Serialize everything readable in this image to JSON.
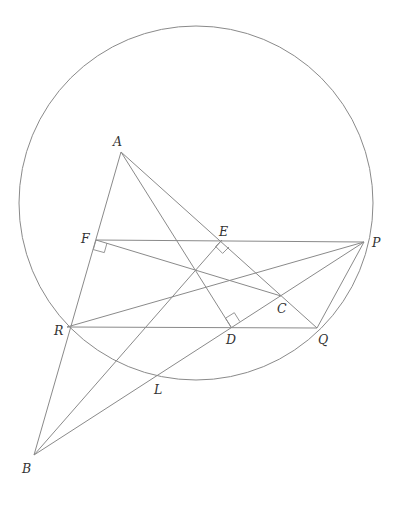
{
  "diagram": {
    "type": "geometry-figure",
    "colors": {
      "line": "#8a8a8a",
      "label": "#333333",
      "background": "#ffffff"
    },
    "circle": {
      "cx": 196,
      "cy": 203,
      "r": 177
    },
    "points": {
      "A": {
        "label": "A",
        "x": 121,
        "y": 152,
        "lx": 113,
        "ly": 146
      },
      "B": {
        "label": "B",
        "x": 34,
        "y": 455,
        "lx": 22,
        "ly": 473
      },
      "C": {
        "label": "C",
        "x": 281,
        "y": 296,
        "lx": 277,
        "ly": 313
      },
      "D": {
        "label": "D",
        "x": 231,
        "y": 327,
        "lx": 226,
        "ly": 344
      },
      "E": {
        "label": "E",
        "x": 222,
        "y": 240,
        "lx": 219,
        "ly": 236
      },
      "F": {
        "label": "F",
        "x": 96,
        "y": 240,
        "lx": 81,
        "ly": 243
      },
      "P": {
        "label": "P",
        "x": 364,
        "y": 242,
        "lx": 372,
        "ly": 247
      },
      "Q": {
        "label": "Q",
        "x": 317,
        "y": 328,
        "lx": 318,
        "ly": 344
      },
      "R": {
        "label": "R",
        "x": 67,
        "y": 327,
        "lx": 54,
        "ly": 335
      },
      "L": {
        "label": "L",
        "x": 156,
        "y": 377,
        "lx": 154,
        "ly": 394
      }
    },
    "segments": [
      {
        "name": "line-AB",
        "from": "A",
        "to": "B"
      },
      {
        "name": "line-AQ",
        "from": "A",
        "to": "Q"
      },
      {
        "name": "altitude-AD",
        "from": "A",
        "to": "D"
      },
      {
        "name": "altitude-BE",
        "from": "B",
        "to": "E"
      },
      {
        "name": "line-BP",
        "from": "B",
        "to": "P"
      },
      {
        "name": "altitude-CF",
        "from": "F",
        "to": "C"
      },
      {
        "name": "line-FP",
        "from": "F",
        "to": "P"
      },
      {
        "name": "line-RQ",
        "from": "R",
        "to": "Q"
      },
      {
        "name": "line-RP",
        "from": "R",
        "to": "P"
      },
      {
        "name": "line-PQ",
        "from": "P",
        "to": "Q"
      }
    ],
    "right_angles": [
      "F",
      "E",
      "D"
    ]
  }
}
